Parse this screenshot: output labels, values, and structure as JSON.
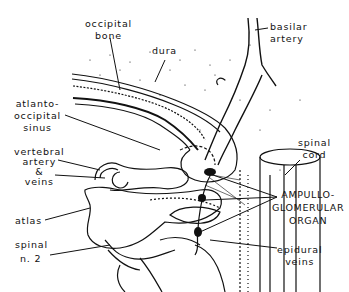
{
  "figure": {
    "type": "anatomical line drawing",
    "labels": {
      "occipital_bone": [
        "occipital",
        "bone"
      ],
      "dura": "dura",
      "basilar_artery": [
        "basilar",
        "artery"
      ],
      "atlanto_occipital_sinus": [
        "atlanto-",
        "occipital",
        "sinus"
      ],
      "spinal_cord": [
        "spinal",
        "cord"
      ],
      "vertebral_artery_veins": [
        "vertebral",
        "artery",
        "&",
        "veins"
      ],
      "ampullo_glomerular_organ": [
        "AMPULLO-",
        "GLOMERULAR",
        "ORGAN"
      ],
      "atlas": "atlas",
      "spinal_n2": [
        "spinal",
        "n. 2"
      ],
      "epidural_veins": [
        "epidural",
        "veins"
      ]
    },
    "colors": {
      "ink": "#111111",
      "background": "#ffffff"
    }
  }
}
